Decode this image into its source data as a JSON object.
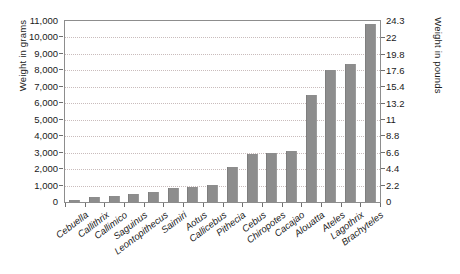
{
  "chart_data": {
    "type": "bar",
    "title": "",
    "subtitle": "",
    "xlabel": "",
    "ylabel": "Weight in grams",
    "y2label": "Weight in pounds",
    "grid": true,
    "legend": false,
    "ylim": [
      0,
      11000
    ],
    "y2lim": [
      0,
      24.3
    ],
    "yticks": [
      "0",
      "1,000",
      "2,000",
      "3,000",
      "4,000",
      "5,000",
      "6,000",
      "7,000",
      "8,000",
      "9,000",
      "10,000",
      "11,000"
    ],
    "ytick_values": [
      0,
      1000,
      2000,
      3000,
      4000,
      5000,
      6000,
      7000,
      8000,
      9000,
      10000,
      11000
    ],
    "y2ticks": [
      "0",
      "2.2",
      "4.4",
      "6.6",
      "8.8",
      "11",
      "13.2",
      "15.4",
      "17.6",
      "19.8",
      "22",
      "24.3"
    ],
    "y2tick_values": [
      0,
      2.2,
      4.4,
      6.6,
      8.8,
      11,
      13.2,
      15.4,
      17.6,
      19.8,
      22,
      24.3
    ],
    "categories": [
      "Cebuella",
      "Callithrix",
      "Callimico",
      "Saguinus",
      "Leontopithecus",
      "Saimiri",
      "Aotus",
      "Callicebus",
      "Pithecia",
      "Cebus",
      "Chiropotes",
      "Cacajao",
      "Alouatta",
      "Ateles",
      "Lagothrix",
      "Brachyteles"
    ],
    "values": [
      120,
      320,
      390,
      470,
      600,
      850,
      900,
      1050,
      2100,
      2900,
      3000,
      3100,
      6500,
      8000,
      8400,
      10800
    ],
    "bar_color": "#8d8d8d",
    "grid_color": "#c9bcbc",
    "axis_color": "#8d8d8d",
    "text_color": "#1a1a1a"
  }
}
